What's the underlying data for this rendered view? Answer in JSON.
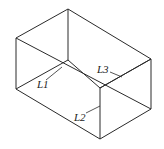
{
  "diagram": {
    "type": "isometric-box",
    "labels": {
      "l1": "L1",
      "l2": "L2",
      "l3": "L3"
    },
    "colors": {
      "line": "#2a2a2a",
      "background": "#ffffff"
    }
  }
}
